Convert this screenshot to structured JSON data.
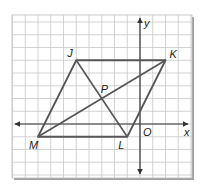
{
  "diagram": {
    "type": "coordinate-grid-parallelogram",
    "grid": {
      "x_min": -10,
      "x_max": 4,
      "y_min": -4,
      "y_max": 8,
      "cell": 1
    },
    "axes": {
      "x_label": "x",
      "y_label": "y",
      "origin_label": "O"
    },
    "points": [
      {
        "label": "J",
        "x": -5,
        "y": 5
      },
      {
        "label": "K",
        "x": 2,
        "y": 5
      },
      {
        "label": "L",
        "x": -1,
        "y": -1
      },
      {
        "label": "M",
        "x": -8,
        "y": -1
      },
      {
        "label": "P",
        "x": -3,
        "y": 2
      }
    ],
    "parallelogram": [
      "J",
      "K",
      "L",
      "M"
    ],
    "diagonals": [
      [
        "J",
        "L"
      ],
      [
        "K",
        "M"
      ]
    ],
    "colors": {
      "grid": "#c8c8c8",
      "axis": "#333333",
      "shape": "#555555",
      "frame_shadow": "#9a9a9a"
    }
  }
}
